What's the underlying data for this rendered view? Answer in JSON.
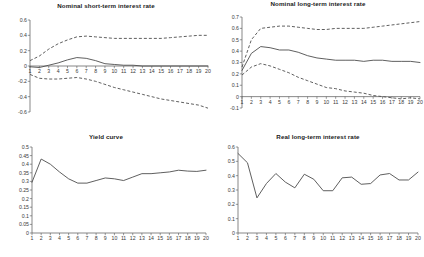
{
  "figure": {
    "background": "#ffffff",
    "line_color": "#4d4d4d",
    "axis_color": "#555555",
    "panel_count": 4
  },
  "panels": {
    "p1": {
      "title": "Nominal short-term interest rate"
    },
    "p2": {
      "title": "Nominal long-term interest rate"
    },
    "p3": {
      "title": "Yield curve"
    },
    "p4": {
      "title": "Real long-term interest rate"
    }
  },
  "chart_data": [
    {
      "id": "nominal-short-term-interest-rate",
      "type": "line",
      "title": "Nominal short-term interest rate",
      "xlabel": "",
      "ylabel": "",
      "grid": false,
      "legend": "none",
      "x": [
        1,
        2,
        3,
        4,
        5,
        6,
        7,
        8,
        9,
        10,
        11,
        12,
        13,
        14,
        15,
        16,
        17,
        18,
        19,
        20
      ],
      "xlim": [
        1,
        20
      ],
      "ylim": [
        -0.6,
        0.6
      ],
      "xticks": [
        "1",
        "2",
        "3",
        "4",
        "5",
        "6",
        "7",
        "8",
        "9",
        "10",
        "11",
        "12",
        "13",
        "14",
        "15",
        "16",
        "17",
        "18",
        "19",
        "20"
      ],
      "yticks": [
        "0.6",
        "0.4",
        "0.2",
        "0",
        "-0.2",
        "-0.4",
        "-0.6"
      ],
      "ytick_values": [
        0.6,
        0.4,
        0.2,
        0,
        -0.2,
        -0.4,
        -0.6
      ],
      "series": [
        {
          "name": "point estimate",
          "style": "solid",
          "values": [
            -0.01,
            -0.02,
            0.01,
            0.04,
            0.08,
            0.11,
            0.1,
            0.07,
            0.03,
            0.02,
            0.01,
            0.01,
            0.0,
            0.0,
            0.0,
            0.0,
            0.0,
            0.0,
            0.0,
            0.0
          ]
        },
        {
          "name": "upper confidence band",
          "style": "dashed",
          "values": [
            0.07,
            0.13,
            0.22,
            0.29,
            0.34,
            0.38,
            0.39,
            0.38,
            0.37,
            0.36,
            0.36,
            0.36,
            0.36,
            0.36,
            0.36,
            0.37,
            0.38,
            0.39,
            0.4,
            0.4
          ]
        },
        {
          "name": "lower confidence band",
          "style": "dashed",
          "values": [
            -0.11,
            -0.16,
            -0.17,
            -0.17,
            -0.16,
            -0.15,
            -0.17,
            -0.2,
            -0.24,
            -0.28,
            -0.31,
            -0.34,
            -0.37,
            -0.4,
            -0.43,
            -0.45,
            -0.47,
            -0.49,
            -0.51,
            -0.55
          ]
        }
      ]
    },
    {
      "id": "nominal-long-term-interest-rate",
      "type": "line",
      "title": "Nominal long-term interest rate",
      "xlabel": "",
      "ylabel": "",
      "grid": false,
      "legend": "none",
      "x": [
        1,
        2,
        3,
        4,
        5,
        6,
        7,
        8,
        9,
        10,
        11,
        12,
        13,
        14,
        15,
        16,
        17,
        18,
        19,
        20
      ],
      "xlim": [
        1,
        20
      ],
      "ylim": [
        -0.1,
        0.7
      ],
      "xticks": [
        "1",
        "2",
        "3",
        "4",
        "5",
        "6",
        "7",
        "8",
        "9",
        "10",
        "11",
        "12",
        "13",
        "14",
        "15",
        "16",
        "17",
        "18",
        "19",
        "20"
      ],
      "yticks": [
        "0.7",
        "0.6",
        "0.5",
        "0.4",
        "0.3",
        "0.2",
        "0.1",
        "0",
        "-0.1"
      ],
      "ytick_values": [
        0.7,
        0.6,
        0.5,
        0.4,
        0.3,
        0.2,
        0.1,
        0,
        -0.1
      ],
      "series": [
        {
          "name": "point estimate",
          "style": "solid",
          "values": [
            0.23,
            0.38,
            0.44,
            0.43,
            0.41,
            0.41,
            0.39,
            0.36,
            0.34,
            0.33,
            0.32,
            0.32,
            0.32,
            0.31,
            0.32,
            0.32,
            0.31,
            0.31,
            0.31,
            0.3
          ]
        },
        {
          "name": "upper confidence band",
          "style": "dashed",
          "values": [
            0.26,
            0.5,
            0.6,
            0.61,
            0.62,
            0.62,
            0.61,
            0.6,
            0.59,
            0.59,
            0.6,
            0.6,
            0.6,
            0.6,
            0.61,
            0.62,
            0.63,
            0.64,
            0.65,
            0.66
          ]
        },
        {
          "name": "lower confidence band",
          "style": "dashed",
          "values": [
            0.19,
            0.26,
            0.29,
            0.27,
            0.24,
            0.21,
            0.17,
            0.14,
            0.11,
            0.08,
            0.07,
            0.05,
            0.04,
            0.03,
            0.01,
            0.0,
            -0.01,
            -0.02,
            -0.01,
            -0.02
          ]
        }
      ]
    },
    {
      "id": "yield-curve",
      "type": "line",
      "title": "Yield curve",
      "xlabel": "",
      "ylabel": "",
      "grid": false,
      "legend": "none",
      "x": [
        1,
        2,
        3,
        4,
        5,
        6,
        7,
        8,
        9,
        10,
        11,
        12,
        13,
        14,
        15,
        16,
        17,
        18,
        19,
        20
      ],
      "xlim": [
        1,
        20
      ],
      "ylim": [
        0,
        0.5
      ],
      "xticks": [
        "1",
        "2",
        "3",
        "4",
        "5",
        "6",
        "7",
        "8",
        "9",
        "10",
        "11",
        "12",
        "13",
        "14",
        "15",
        "16",
        "17",
        "18",
        "19",
        "20"
      ],
      "yticks": [
        "0.5",
        "0.45",
        "0.4",
        "0.35",
        "0.3",
        "0.25",
        "0.2",
        "0.15",
        "0.1",
        "0.05",
        "0"
      ],
      "ytick_values": [
        0.5,
        0.45,
        0.4,
        0.35,
        0.3,
        0.25,
        0.2,
        0.15,
        0.1,
        0.05,
        0
      ],
      "series": [
        {
          "name": "yield curve",
          "style": "solid",
          "values": [
            0.295,
            0.43,
            0.4,
            0.355,
            0.315,
            0.29,
            0.29,
            0.305,
            0.32,
            0.315,
            0.305,
            0.325,
            0.345,
            0.345,
            0.35,
            0.355,
            0.365,
            0.36,
            0.358,
            0.365
          ]
        }
      ]
    },
    {
      "id": "real-long-term-interest-rate",
      "type": "line",
      "title": "Real long-term interest rate",
      "xlabel": "",
      "ylabel": "",
      "grid": false,
      "legend": "none",
      "x": [
        1,
        2,
        3,
        4,
        5,
        6,
        7,
        8,
        9,
        10,
        11,
        12,
        13,
        14,
        15,
        16,
        17,
        18,
        19,
        20
      ],
      "xlim": [
        1,
        20
      ],
      "ylim": [
        0,
        0.6
      ],
      "xticks": [
        "1",
        "2",
        "3",
        "4",
        "5",
        "6",
        "7",
        "8",
        "9",
        "10",
        "11",
        "12",
        "13",
        "14",
        "15",
        "16",
        "17",
        "18",
        "19",
        "20"
      ],
      "yticks": [
        "0.6",
        "0.5",
        "0.4",
        "0.3",
        "0.2",
        "0.1",
        "0"
      ],
      "ytick_values": [
        0.6,
        0.5,
        0.4,
        0.3,
        0.2,
        0.1,
        0
      ],
      "series": [
        {
          "name": "real long-term interest rate",
          "style": "solid",
          "values": [
            0.555,
            0.49,
            0.245,
            0.345,
            0.415,
            0.355,
            0.315,
            0.41,
            0.375,
            0.295,
            0.295,
            0.385,
            0.39,
            0.34,
            0.345,
            0.405,
            0.415,
            0.37,
            0.37,
            0.425
          ]
        }
      ]
    }
  ]
}
